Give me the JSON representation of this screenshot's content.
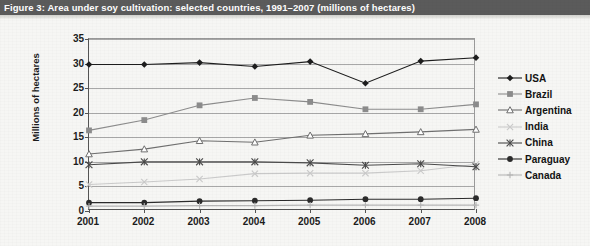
{
  "figure": {
    "title": "Figure 3: Area under soy cultivation: selected countries, 1991–2007 (millions of hectares)"
  },
  "chart_data": {
    "type": "line",
    "title": "Figure 3: Area under soy cultivation: selected countries, 1991–2007 (millions of hectares)",
    "xlabel": "",
    "ylabel": "Millions of hectares",
    "categories": [
      "2001",
      "2002",
      "2003",
      "2004",
      "2005",
      "2006",
      "2007",
      "2008"
    ],
    "x": [
      2001,
      2002,
      2003,
      2004,
      2005,
      2006,
      2007,
      2008
    ],
    "ylim": [
      0,
      35
    ],
    "yticks": [
      0,
      5,
      10,
      15,
      20,
      25,
      30,
      35
    ],
    "grid": true,
    "legend_position": "right",
    "series": [
      {
        "name": "USA",
        "marker": "diamond",
        "color": "#1d1d1d",
        "values": [
          29.8,
          29.8,
          30.2,
          29.4,
          30.4,
          26.0,
          30.5,
          31.2
        ]
      },
      {
        "name": "Brazil",
        "marker": "square",
        "color": "#8c8c8c",
        "values": [
          16.4,
          18.5,
          21.5,
          23.0,
          22.2,
          20.7,
          20.7,
          21.7
        ]
      },
      {
        "name": "Argentina",
        "marker": "triangle",
        "color": "#6f6f6f",
        "values": [
          11.6,
          12.6,
          14.3,
          14.0,
          15.4,
          15.7,
          16.1,
          16.6
        ]
      },
      {
        "name": "India",
        "marker": "cross-x",
        "color": "#cacaca",
        "values": [
          5.4,
          5.9,
          6.5,
          7.6,
          7.7,
          7.7,
          8.2,
          9.5
        ]
      },
      {
        "name": "China",
        "marker": "asterisk",
        "color": "#4a4a4a",
        "values": [
          9.4,
          10.0,
          10.0,
          10.0,
          9.8,
          9.3,
          9.6,
          9.0
        ]
      },
      {
        "name": "Paraguay",
        "marker": "circle",
        "color": "#2b2b2b",
        "values": [
          1.7,
          1.7,
          2.0,
          2.1,
          2.2,
          2.4,
          2.4,
          2.6
        ]
      },
      {
        "name": "Canada",
        "marker": "plus",
        "color": "#b5b5b5",
        "values": [
          1.0,
          1.0,
          1.1,
          1.1,
          1.2,
          1.2,
          1.2,
          1.2
        ]
      }
    ]
  },
  "legend": {
    "items": [
      {
        "label": "USA"
      },
      {
        "label": "Brazil"
      },
      {
        "label": "Argentina"
      },
      {
        "label": "India"
      },
      {
        "label": "China"
      },
      {
        "label": "Paraguay"
      },
      {
        "label": "Canada"
      }
    ]
  },
  "colors": {
    "title_bar_bg": "#5b5b5b",
    "title_text": "#ffffff",
    "page_bg": "#f6f6f4",
    "axis": "#555555",
    "gridline": "#a8a8a8"
  }
}
